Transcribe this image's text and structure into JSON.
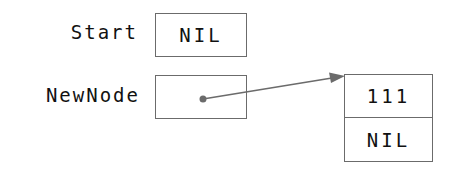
{
  "diagram": {
    "type": "linked-list-pointer-diagram",
    "variables": [
      {
        "label": "Start",
        "value": "NIL"
      },
      {
        "label": "NewNode",
        "value": ""
      }
    ],
    "node": {
      "data": "111",
      "next": "NIL"
    },
    "edges": [
      {
        "from": "NewNode",
        "to": "node",
        "style": "arrow"
      }
    ],
    "colors": {
      "line": "#6b6b6b",
      "text": "#111111"
    }
  }
}
